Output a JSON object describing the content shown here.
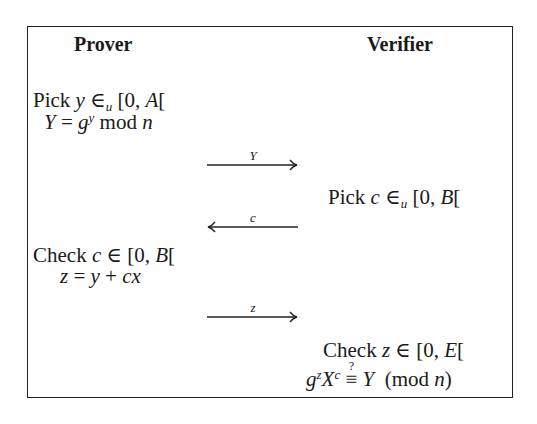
{
  "protocol": {
    "columns": {
      "prover": "Prover",
      "verifier": "Verifier"
    },
    "prover_step1": {
      "line1": {
        "verb": "Pick",
        "var": "y",
        "rel": "∈",
        "rel_sub": "u",
        "range": "[0,",
        "bound": "A",
        "close": "["
      },
      "line2": {
        "lhs": "Y",
        "eq": "=",
        "base": "g",
        "exp": "y",
        "op": "mod",
        "mod": "n"
      }
    },
    "message1": {
      "label": "Y",
      "direction": "right"
    },
    "verifier_step1": {
      "verb": "Pick",
      "var": "c",
      "rel": "∈",
      "rel_sub": "u",
      "range": "[0,",
      "bound": "B",
      "close": "["
    },
    "message2": {
      "label": "c",
      "direction": "left"
    },
    "prover_step2": {
      "line1": {
        "verb": "Check",
        "var": "c",
        "rel": "∈",
        "range": "[0,",
        "bound": "B",
        "close": "["
      },
      "line2": {
        "lhs": "z",
        "eq": "=",
        "a": "y",
        "plus": "+",
        "b": "cx"
      }
    },
    "message3": {
      "label": "z",
      "direction": "right"
    },
    "verifier_step2": {
      "line1": {
        "verb": "Check",
        "var": "z",
        "rel": "∈",
        "range": "[0,",
        "bound": "E",
        "close": "["
      },
      "line2": {
        "g": "g",
        "g_exp": "z",
        "X": "X",
        "X_exp": "c",
        "equiv": "≡",
        "question": "?",
        "rhs": "Y",
        "mod_open": "(mod",
        "mod_n": "n",
        "mod_close": ")"
      }
    }
  }
}
